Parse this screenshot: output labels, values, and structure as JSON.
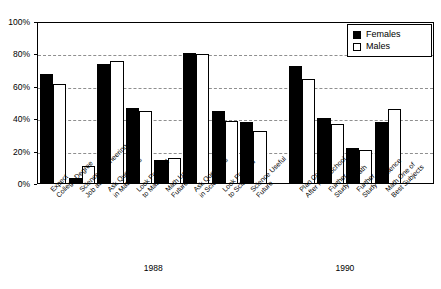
{
  "chart_data": {
    "type": "bar",
    "title": "",
    "xlabel": "",
    "ylabel": "",
    "ylim": [
      0,
      100
    ],
    "yticks": [
      "0%",
      "20%",
      "40%",
      "60%",
      "80%",
      "100%"
    ],
    "ytick_values": [
      0,
      20,
      40,
      60,
      80,
      100
    ],
    "grid": true,
    "legend_position": "top-right",
    "legend": [
      "Females",
      "Males"
    ],
    "group_labels": [
      "1988",
      "1990"
    ],
    "categories": [
      "Expect College Degree",
      "Science/Engineering Job at 30",
      "Ask Questions in Math",
      "Look Forward to Math",
      "Math Useful Future",
      "Ask Questions in Science",
      "Look Forward to Science",
      "Science Useful Future",
      "Plan College After High School",
      "Further Study in Math",
      "Further Study in Science",
      "Math One of Best Subjects"
    ],
    "category_lines": [
      [
        "Expect",
        "College Degree"
      ],
      [
        "Science/Engineering",
        "Job at 30"
      ],
      [
        "Ask Questions",
        "in Math"
      ],
      [
        "Look Forward",
        "to Math"
      ],
      [
        "Math Useful",
        "Future"
      ],
      [
        "Ask Questions",
        "in Science"
      ],
      [
        "Look Forward",
        "to Science"
      ],
      [
        "Science Useful",
        "Future"
      ],
      [
        "Plan College",
        "After High School"
      ],
      [
        "Further",
        "Study in Math"
      ],
      [
        "Further",
        "Study in Science"
      ],
      [
        "Math One of",
        "Best Subjects"
      ]
    ],
    "category_group": [
      "1988",
      "1988",
      "1988",
      "1988",
      "1988",
      "1988",
      "1988",
      "1988",
      "1990",
      "1990",
      "1990",
      "1990"
    ],
    "series": [
      {
        "name": "Females",
        "color": "#000000",
        "values": [
          68,
          4,
          74,
          47,
          15,
          81,
          45,
          38,
          73,
          41,
          22,
          38
        ]
      },
      {
        "name": "Males",
        "color": "#ffffff",
        "values": [
          62,
          11,
          76,
          45,
          16,
          80,
          39,
          33,
          65,
          37,
          21,
          46
        ]
      }
    ]
  },
  "colors": {
    "female": "#000000",
    "male": "#ffffff",
    "axis": "#000000",
    "grid": "#8f8f8f",
    "background": "#ffffff"
  }
}
